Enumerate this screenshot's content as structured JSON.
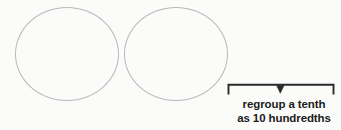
{
  "figure": {
    "type": "math-worksheet-diagram",
    "background_color": "#fbfbfa",
    "shapes": {
      "circle_left": {
        "name": "empty-circle",
        "stroke_color": "#b9b9bb"
      },
      "circle_right": {
        "name": "empty-circle",
        "stroke_color": "#b9b9bb"
      }
    },
    "bracket": {
      "name": "regroup-bracket",
      "color": "#2a2a2a",
      "arrow_direction": "down"
    },
    "annotation": {
      "line_1": "regroup a tenth",
      "line_2": "as 10 hundredths",
      "color": "#1b1b1b"
    }
  }
}
